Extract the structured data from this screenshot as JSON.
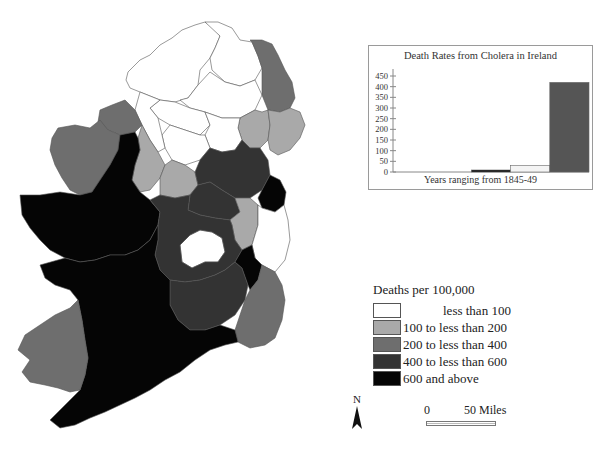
{
  "map": {
    "title": "Cholera death rates in Ireland by county, 1845-49",
    "colors": {
      "less_than_100": "#ffffff",
      "100_to_200": "#a9a9a9",
      "200_to_400": "#6e6e6e",
      "400_to_600": "#333333",
      "600_plus": "#050505"
    }
  },
  "legend": {
    "title": "Deaths per 100,000",
    "items": [
      {
        "label": "less than 100",
        "color": "#ffffff"
      },
      {
        "label": "100 to less than 200",
        "color": "#a9a9a9"
      },
      {
        "label": "200 to less than 400",
        "color": "#6e6e6e"
      },
      {
        "label": "400 to less than 600",
        "color": "#333333"
      },
      {
        "label": "600 and above",
        "color": "#050505"
      }
    ]
  },
  "north_arrow": {
    "label": "N"
  },
  "scale_bar": {
    "start": "0",
    "end": "50 Miles"
  },
  "chart_data": {
    "type": "bar",
    "title": "Death Rates from Cholera in Ireland",
    "xlabel": "Years ranging from 1845-49",
    "ylabel": "",
    "ylim": [
      0,
      450
    ],
    "yticks": [
      "0",
      "50",
      "100",
      "150",
      "200",
      "250",
      "300",
      "350",
      "400",
      "450"
    ],
    "categories": [
      "1845",
      "1846",
      "1847",
      "1848",
      "1849"
    ],
    "values": [
      0,
      0,
      5,
      30,
      420
    ],
    "bar_colors": [
      "#ffffff",
      "#ffffff",
      "#111111",
      "#f4f4f4",
      "#555555"
    ],
    "grid": false,
    "legend": "none"
  }
}
